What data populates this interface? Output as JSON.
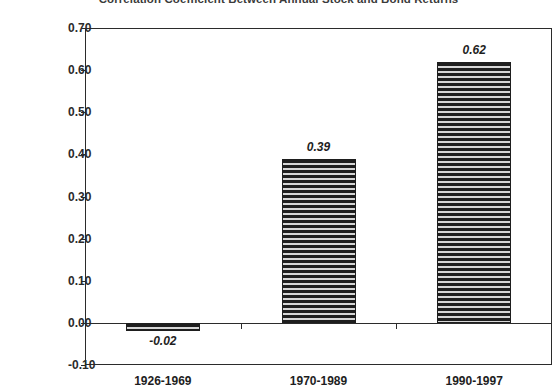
{
  "chart_data": {
    "type": "bar",
    "title": "Correlation Coefficient Between Annual Stock and Bond Returns",
    "xlabel": "",
    "ylabel": "",
    "categories": [
      "1926-1969",
      "1970-1989",
      "1990-1997"
    ],
    "values": [
      -0.02,
      0.39,
      0.62
    ],
    "value_labels": [
      "-0.02",
      "0.39",
      "0.62"
    ],
    "ylim": [
      -0.1,
      0.7
    ],
    "ytick_values": [
      0.7,
      0.6,
      0.5,
      0.4,
      0.3,
      0.2,
      0.1,
      0.0,
      -0.1
    ],
    "ytick_labels": [
      "0.70",
      "0.60",
      "0.50",
      "0.40",
      "0.30",
      "0.20",
      "0.10",
      "0.00",
      "-0.10"
    ],
    "grid": false,
    "legend": null,
    "legend_position": "none",
    "series": [
      {
        "name": "Correlation Coefficient",
        "values": [
          -0.02,
          0.39,
          0.62
        ],
        "fill": "horizontal-line-hatch",
        "color": "#1e1e1e"
      }
    ],
    "zero_line": 0.0,
    "annotations": []
  },
  "colors": {
    "axis": "#2b2b2b",
    "bar_line": "#1e1e1e",
    "bar_fill": "#d6d6d6",
    "text": "#1e1e1e",
    "title_text": "#3b3b3b",
    "background": "#ffffff"
  }
}
